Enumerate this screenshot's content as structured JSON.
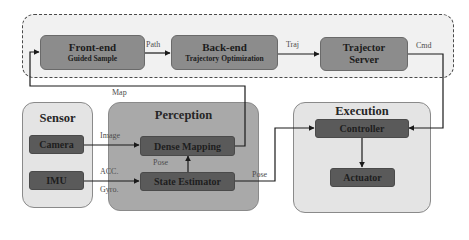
{
  "planning": {
    "frontend": {
      "title": "Front-end",
      "subtitle": "Guided Sample"
    },
    "backend": {
      "title": "Back-end",
      "subtitle": "Trajectory Optimization"
    },
    "server": {
      "title_line1": "Trajector",
      "title_line2": "Server"
    }
  },
  "sensor": {
    "title": "Sensor",
    "camera": "Camera",
    "imu": "IMU"
  },
  "perception": {
    "title": "Perception",
    "dense_mapping": "Dense Mapping",
    "state_estimator": "State Estimator"
  },
  "execution": {
    "title": "Execution",
    "controller": "Controller",
    "actuator": "Actuator"
  },
  "edges": {
    "path": "Path",
    "traj": "Traj",
    "cmd": "Cmd",
    "map": "Map",
    "image": "Image",
    "acc": "ACC.",
    "gyro": "Gyro.",
    "pose_internal": "Pose",
    "pose_out": "Pose"
  },
  "colors": {
    "outer_bg": "#f1f1f1",
    "top_node": "#8c8c8c",
    "dark_node": "#5a5a5a",
    "panel_light": "#e4e4e4",
    "panel_mid": "#a9a9a9",
    "line": "#1a1a1a"
  }
}
